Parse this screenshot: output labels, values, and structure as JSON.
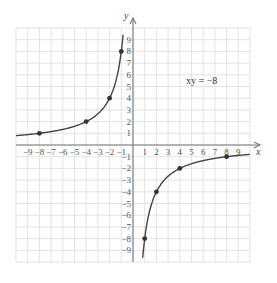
{
  "chart_data": {
    "type": "line",
    "title": "",
    "equation_label": "xy = −8",
    "xlabel": "x",
    "ylabel": "y",
    "xlim": [
      -10,
      10
    ],
    "ylim": [
      -10,
      10
    ],
    "grid": true,
    "x_ticks": [
      "−9",
      "−8",
      "−7",
      "−6",
      "−5",
      "−4",
      "−3",
      "−2",
      "−1",
      "1",
      "2",
      "3",
      "4",
      "5",
      "6",
      "7",
      "8",
      "9"
    ],
    "y_ticks": [
      "9",
      "8",
      "7",
      "6",
      "5",
      "4",
      "3",
      "2",
      "1",
      "−1",
      "−2",
      "−3",
      "−4",
      "−5",
      "−6",
      "−7",
      "−8",
      "−9"
    ],
    "series": [
      {
        "name": "left branch (x<0)",
        "function": "y = -8/x",
        "points": [
          [
            -8,
            1
          ],
          [
            -4,
            2
          ],
          [
            -2,
            4
          ],
          [
            -1,
            8
          ]
        ]
      },
      {
        "name": "right branch (x>0)",
        "function": "y = -8/x",
        "points": [
          [
            1,
            -8
          ],
          [
            2,
            -4
          ],
          [
            4,
            -2
          ],
          [
            8,
            -1
          ]
        ]
      }
    ]
  }
}
